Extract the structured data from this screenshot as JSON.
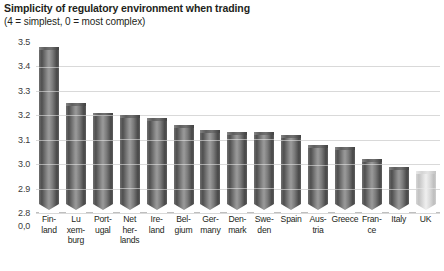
{
  "chart_data": {
    "type": "bar",
    "title": "Simplicity of regulatory environment when trading",
    "subtitle": "(4 = simplest, 0 = most complex)",
    "xlabel": "",
    "ylabel": "",
    "ylim": [
      2.8,
      3.5
    ],
    "axis_break": true,
    "grid": true,
    "legend": "none",
    "ytick_labels": [
      "3.5",
      "3.4",
      "3.3",
      "3.2",
      "3.1",
      "3.0",
      "2.9",
      "2.8",
      "0,0"
    ],
    "ytick_values": [
      3.5,
      3.4,
      3.3,
      3.2,
      3.1,
      3.0,
      2.9,
      2.8,
      0.0
    ],
    "categories": [
      "Finland",
      "Luxemburg",
      "Portugal",
      "Netherlands",
      "Ireland",
      "Belgium",
      "Germany",
      "Denmark",
      "Sweden",
      "Spain",
      "Austria",
      "Greece",
      "France",
      "Italy",
      "UK"
    ],
    "category_lines": [
      [
        "Fin-",
        "land"
      ],
      [
        "Lu",
        "xem-",
        "burg"
      ],
      [
        "Port-",
        "ugal"
      ],
      [
        "Net",
        "her-",
        "lands"
      ],
      [
        "Ire-",
        "land"
      ],
      [
        "Bel-",
        "gium"
      ],
      [
        "Ger-",
        "many"
      ],
      [
        "Den-",
        "mark"
      ],
      [
        "Swe-",
        "den"
      ],
      [
        "Spain"
      ],
      [
        "Aus-",
        "tria"
      ],
      [
        "Greece"
      ],
      [
        "Fran-",
        "ce"
      ],
      [
        "Italy"
      ],
      [
        "UK"
      ]
    ],
    "values": [
      3.48,
      3.25,
      3.21,
      3.2,
      3.19,
      3.16,
      3.14,
      3.13,
      3.13,
      3.12,
      3.08,
      3.07,
      3.02,
      2.99,
      2.97
    ],
    "highlight_index": 14,
    "colors": {
      "bar": "#6f6f6f",
      "bar_highlight": "#d9d9d9",
      "gridline": "#d9d9d9",
      "text": "#231f20",
      "background": "#ffffff"
    }
  }
}
